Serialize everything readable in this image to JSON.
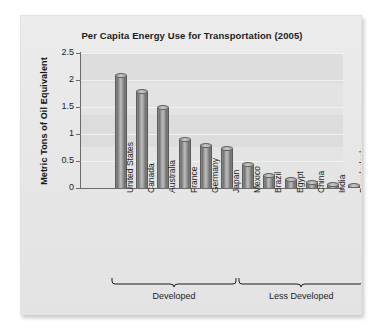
{
  "chart_data": {
    "type": "bar",
    "title": "Per Capita Energy Use for Transportation (2005)",
    "xlabel": "",
    "ylabel": "Metric Tons of Oil Equivalent",
    "ylim": [
      0,
      2.5
    ],
    "yticks": [
      "0",
      "0.5",
      "1",
      "1.5",
      "2",
      "2.5"
    ],
    "ytick_values": [
      0,
      0.5,
      1,
      1.5,
      2,
      2.5
    ],
    "grid": true,
    "legend": "none",
    "categories": [
      "United States",
      "Canada",
      "Australia",
      "France",
      "Germany",
      "Japan",
      "Mexico",
      "Brazil",
      "Egypt",
      "China",
      "India",
      "Bangladesh"
    ],
    "values": [
      2.08,
      1.78,
      1.48,
      0.88,
      0.78,
      0.72,
      0.42,
      0.22,
      0.14,
      0.1,
      0.06,
      0.04
    ],
    "groups": [
      {
        "label": "Developed",
        "start": 0,
        "end": 5
      },
      {
        "label": "Less Developed",
        "start": 6,
        "end": 11
      }
    ],
    "bar_color": "#8d8d8d",
    "plot_background": "#e4e4e4",
    "card_background": "#e9e9e9",
    "axis_color": "#6b6b6b",
    "text_color": "#1d1d1d"
  }
}
